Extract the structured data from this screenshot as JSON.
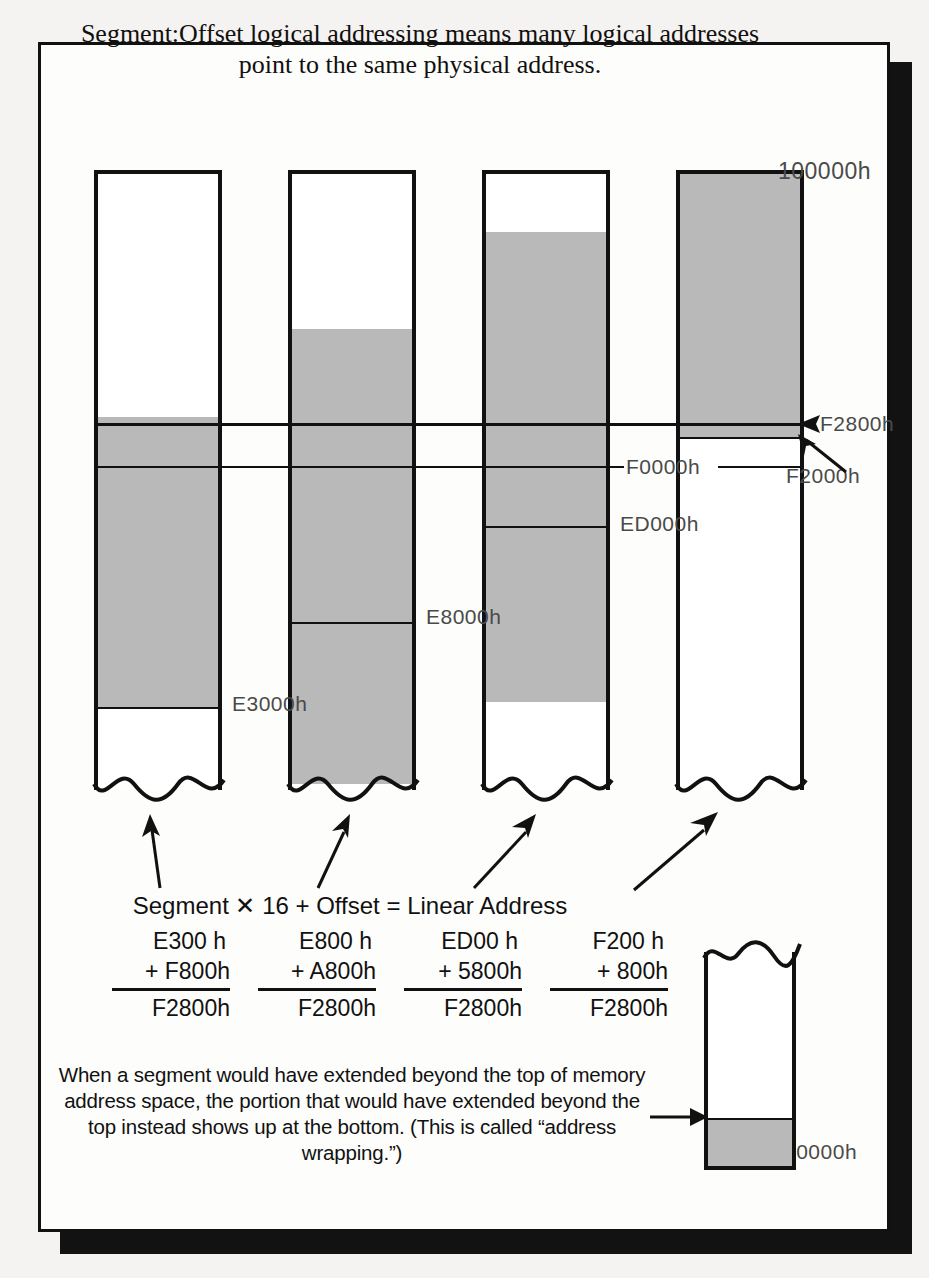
{
  "title": "Segment:Offset logical addressing means many logical addresses point to the same physical address.",
  "diagram": {
    "top_label": "100000h",
    "bottom_label": "00000h",
    "line_labels": {
      "f2800": "F2800h",
      "f2000": "F2000h",
      "f0000": "F0000h",
      "ed000": "ED000h",
      "e8000": "E8000h",
      "e3000": "E3000h"
    },
    "columns": [
      {
        "name": "column-1",
        "base_label": "E3000h",
        "segment": "E300",
        "offset": "F800h",
        "result": "F2800h"
      },
      {
        "name": "column-2",
        "base_label": "E8000h",
        "segment": "E800",
        "offset": "A800h",
        "result": "F2800h"
      },
      {
        "name": "column-3",
        "base_label": "ED000h",
        "segment": "ED00",
        "offset": "5800h",
        "result": "F2800h"
      },
      {
        "name": "column-4",
        "base_label": "F2000h",
        "segment": "F200",
        "offset": "800h",
        "result": "F2800h"
      }
    ]
  },
  "equation": {
    "formula": "Segment ✕ 16 + Offset = Linear Address",
    "sums": [
      {
        "seg": "E300  h",
        "off": "+ F800h",
        "total": "F2800h"
      },
      {
        "seg": "E800  h",
        "off": "+ A800h",
        "total": "F2800h"
      },
      {
        "seg": "ED00  h",
        "off": "+ 5800h",
        "total": "F2800h"
      },
      {
        "seg": "F200  h",
        "off": "+   800h",
        "total": "F2800h"
      }
    ]
  },
  "footnote": "When a segment would have extended beyond the top of memory address space, the portion that would have extended beyond the top instead shows up at the bottom. (This is called “address wrapping.”)"
}
